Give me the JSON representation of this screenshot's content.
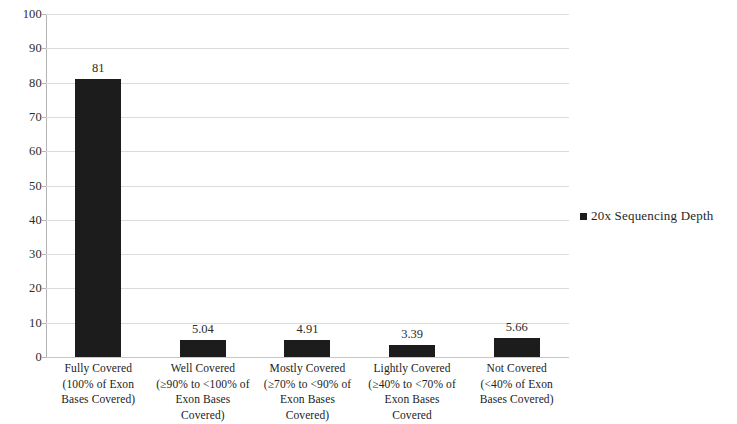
{
  "chart_data": {
    "type": "bar",
    "title": "",
    "xlabel": "",
    "ylabel": "",
    "ylim": [
      0,
      100
    ],
    "ytick_step": 10,
    "ytick_labels": [
      "100",
      "90",
      "80",
      "70",
      "60",
      "50",
      "40",
      "30",
      "20",
      "10",
      "0"
    ],
    "grid": true,
    "legend_position": "right",
    "bar_color": "#1c1c1c",
    "gridline_color": "#dcdcdc",
    "axis_color": "#b4b4b4",
    "categories": [
      "Fully Covered (100% of Exon Bases Covered)",
      "Well Covered (≥90% to <100% of Exon Bases Covered)",
      "Mostly Covered (≥70% to <90% of Exon Bases Covered)",
      "Lightly Covered (≥40% to <70% of Exon Bases Covered",
      "Not Covered (<40% of Exon Bases Covered)"
    ],
    "category_lines": [
      [
        "Fully Covered",
        "(100% of Exon",
        "Bases Covered)"
      ],
      [
        "Well Covered",
        "(≥90% to <100% of",
        "Exon Bases",
        "Covered)"
      ],
      [
        "Mostly Covered",
        "(≥70% to <90% of",
        "Exon Bases",
        "Covered)"
      ],
      [
        "Lightly Covered",
        "(≥40% to <70% of",
        "Exon Bases",
        "Covered"
      ],
      [
        "Not Covered",
        "(<40% of Exon",
        "Bases Covered)"
      ]
    ],
    "values": [
      81,
      5.04,
      4.91,
      3.39,
      5.66
    ],
    "value_labels": [
      "81",
      "5.04",
      "4.91",
      "3.39",
      "5.66"
    ],
    "series": [
      {
        "name": "20x Sequencing Depth",
        "values": [
          81,
          5.04,
          4.91,
          3.39,
          5.66
        ]
      }
    ],
    "legend": [
      "20x Sequencing Depth"
    ]
  },
  "legend": {
    "entry_label": "20x Sequencing Depth"
  }
}
